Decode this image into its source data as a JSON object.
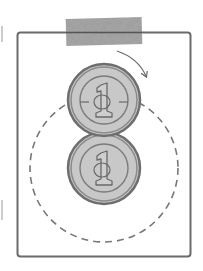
{
  "diagram": {
    "title": "Coin rolling around a fixed coin",
    "colors": {
      "background": "#ffffff",
      "frame_stroke": "#6b6b6b",
      "tape_fill": "#a8a8a8",
      "coin_fill": "#c8c8c8",
      "coin_rim": "#6e6e6e",
      "coin_inner_ring": "#7a7a7a",
      "numeral_stroke": "#6a6a6a",
      "dashed_path": "#777777",
      "arrow": "#6a6a6a"
    },
    "frame": {
      "label": "frame"
    },
    "tape": {
      "label": "tape"
    },
    "coins": [
      {
        "label": "rolling-coin",
        "numeral": "1",
        "position": "top"
      },
      {
        "label": "fixed-coin",
        "numeral": "1",
        "position": "bottom"
      }
    ],
    "path": {
      "label": "dashed-orbit-path",
      "style": "dashed"
    },
    "arrow": {
      "label": "rotation-direction",
      "direction": "clockwise"
    }
  }
}
